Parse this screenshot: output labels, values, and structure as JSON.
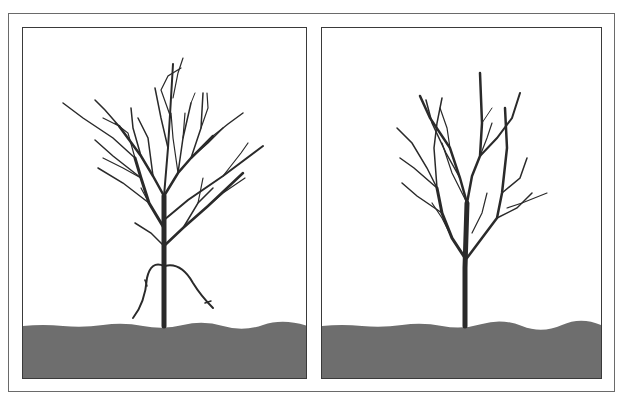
{
  "figure": {
    "type": "illustration",
    "colors": {
      "background": "#ffffff",
      "ground": "#6e6e6e",
      "branch": "#2a2a2a",
      "frame": "#3a3a3a"
    },
    "panels": [
      {
        "id": "left",
        "label": "",
        "state": "before pruning (dense branches, low suckers)"
      },
      {
        "id": "right",
        "label": "",
        "state": "after pruning (thinned branches, suckers removed)"
      }
    ]
  }
}
